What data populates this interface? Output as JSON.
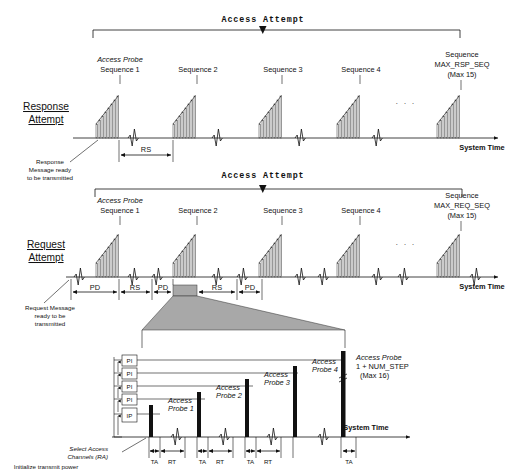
{
  "diagram": {
    "title_top": "Access Attempt",
    "title_mid": "Access Attempt",
    "rows": [
      {
        "name": "response-attempt",
        "side_label_line1": "Response",
        "side_label_line2": "Attempt",
        "first_seq_tag": "Access Probe",
        "first_seq_label": "Sequence 1",
        "sequences": [
          "Sequence 2",
          "Sequence 3",
          "Sequence 4"
        ],
        "last_seq_line1": "Sequence",
        "last_seq_line2": "MAX_RSP_SEQ",
        "last_seq_line3": "(Max 15)",
        "ellipsis": ". . .",
        "axis_label": "System Time",
        "callout_line1": "Response",
        "callout_line2": "Message ready",
        "callout_line3": "to be transmitted",
        "interval_labels": [
          "RS"
        ]
      },
      {
        "name": "request-attempt",
        "side_label_line1": "Request",
        "side_label_line2": "Attempt",
        "first_seq_tag": "Access Probe",
        "first_seq_label": "Sequence 1",
        "sequences": [
          "Sequence 2",
          "Sequence 3",
          "Sequence 4"
        ],
        "last_seq_line1": "Sequence",
        "last_seq_line2": "MAX_REQ_SEQ",
        "last_seq_line3": "(Max 15)",
        "ellipsis": ". . .",
        "axis_label": "System Time",
        "callout_line1": "Request Message",
        "callout_line2": "ready to be",
        "callout_line3": "transmitted",
        "interval_labels": [
          "PD",
          "RS",
          "PD",
          "RS",
          "PD"
        ]
      }
    ],
    "detail": {
      "name": "access-probe-sequence-detail",
      "power_step_labels": [
        "PI",
        "PI",
        "PI",
        "PI"
      ],
      "initial_power_label": "IP",
      "probes": [
        {
          "line1": "Access",
          "line2": "Probe 1"
        },
        {
          "line1": "Access",
          "line2": "Probe 2"
        },
        {
          "line1": "Access",
          "line2": "Probe 3"
        },
        {
          "line1": "Access",
          "line2": "Probe 4"
        }
      ],
      "last_probe_line1": "Access Probe",
      "last_probe_line2": "1 + NUM_STEP",
      "last_probe_line3": "(Max 16)",
      "interval_labels": [
        "TA",
        "RT",
        "TA",
        "RT",
        "TA",
        "RT",
        "TA"
      ],
      "note_line1": "Select Access",
      "note_line2": "Channels (RA)",
      "note_line3": "Initialize transmit power",
      "axis_label": "System Time"
    },
    "colors": {
      "line": "#111111",
      "gray_fill": "#a8a8a8",
      "probe_fill": "#111111",
      "background": "#ffffff"
    }
  }
}
